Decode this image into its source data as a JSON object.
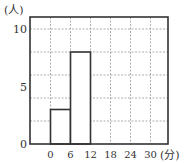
{
  "chart_data": {
    "type": "bar",
    "subtype": "histogram",
    "title": "",
    "xlabel": "(分)",
    "ylabel": "(人)",
    "x_ticks": [
      0,
      6,
      12,
      18,
      24,
      30
    ],
    "x_tick_labels": [
      "0",
      "6",
      "12",
      "18",
      "24",
      "30"
    ],
    "y_tick_labels": [
      "0",
      "5",
      "10"
    ],
    "y_grid_step": 2,
    "x_grid_step": 6,
    "xlim": [
      -6,
      36
    ],
    "ylim": [
      0,
      11
    ],
    "grid": true,
    "bins": [
      {
        "start": 0,
        "end": 6,
        "value": 3
      },
      {
        "start": 6,
        "end": 12,
        "value": 8
      }
    ],
    "categories": [
      "0-6",
      "6-12"
    ],
    "values": [
      3,
      8
    ],
    "colors": {
      "frame": "#333333",
      "bar_outline": "#333333",
      "grid": "#9a9a9a",
      "text": "#333333"
    }
  }
}
